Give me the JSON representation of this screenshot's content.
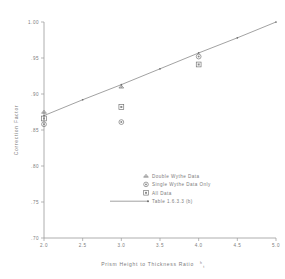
{
  "chart_data": {
    "type": "scatter",
    "title": "",
    "xlabel": "Prism Height to Thickness Ratio h/t",
    "xlabel_main": "Prism Height to Thickness Ratio",
    "xlabel_frac_num": "h",
    "xlabel_frac_den": "t",
    "ylabel": "Correction Factor",
    "xlim": [
      2.0,
      5.0
    ],
    "ylim": [
      0.7,
      1.0
    ],
    "xticks": [
      "2.0",
      "2.5",
      "3.0",
      "3.5",
      "4.0",
      "4.5",
      "5.0"
    ],
    "xtick_values": [
      2.0,
      2.5,
      3.0,
      3.5,
      4.0,
      4.5,
      5.0
    ],
    "yticks": [
      ".70",
      ".75",
      ".80",
      ".85",
      ".90",
      ".95",
      "1.00"
    ],
    "ytick_values": [
      0.7,
      0.75,
      0.8,
      0.85,
      0.9,
      0.95,
      1.0
    ],
    "grid": false,
    "legend_position": "lower-right",
    "series": [
      {
        "name": "Double Wythe Data",
        "marker": "triangle",
        "points": [
          {
            "x": 2.0,
            "y": 0.875
          },
          {
            "x": 3.0,
            "y": 0.91
          }
        ]
      },
      {
        "name": "Single Wythe Data Only",
        "marker": "circle",
        "points": [
          {
            "x": 2.0,
            "y": 0.858
          },
          {
            "x": 3.0,
            "y": 0.861
          },
          {
            "x": 4.0,
            "y": 0.952
          }
        ]
      },
      {
        "name": "All Data",
        "marker": "square",
        "points": [
          {
            "x": 2.0,
            "y": 0.866
          },
          {
            "x": 3.0,
            "y": 0.882
          },
          {
            "x": 4.0,
            "y": 0.941
          }
        ]
      },
      {
        "name": "Table 1.6.3.3 (b)",
        "marker": "line",
        "points": [
          {
            "x": 2.0,
            "y": 0.87
          },
          {
            "x": 2.5,
            "y": 0.892
          },
          {
            "x": 3.0,
            "y": 0.913
          },
          {
            "x": 3.5,
            "y": 0.935
          },
          {
            "x": 4.0,
            "y": 0.957
          },
          {
            "x": 4.5,
            "y": 0.978
          },
          {
            "x": 5.0,
            "y": 1.0
          }
        ]
      }
    ],
    "legend": [
      {
        "label": "Double Wythe Data",
        "marker": "triangle"
      },
      {
        "label": "Single Wythe Data Only",
        "marker": "circle"
      },
      {
        "label": "All Data",
        "marker": "square"
      },
      {
        "label": "Table 1.6.3.3 (b)",
        "marker": "line-with-dot"
      }
    ],
    "colors": {
      "axis": "#9a9a9a",
      "text": "#7c7c7c",
      "marker": "#6e6e6e",
      "line": "#7a7a7a",
      "background": "#ffffff"
    }
  }
}
